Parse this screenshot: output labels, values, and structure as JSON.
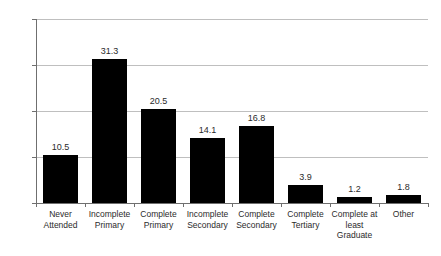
{
  "chart_data": {
    "type": "bar",
    "title": "",
    "subtitle": "",
    "xlabel": "",
    "ylabel": "",
    "ylim": [
      0,
      40
    ],
    "yticks": [
      "0",
      "10",
      "20",
      "30",
      "40"
    ],
    "grid": true,
    "legend": false,
    "bar_color": "#000000",
    "gridline_color": "#bfbfbf",
    "axis_color": "#6f6f6f",
    "categories": [
      "Never\nAttended",
      "Incomplete\nPrimary",
      "Complete\nPrimary",
      "Incomplete\nSecondary",
      "Complete\nSecondary",
      "Complete\nTertiary",
      "Complete at\nleast\nGraduate",
      "Other"
    ],
    "values": [
      10.5,
      31.3,
      20.5,
      14.1,
      16.8,
      3.9,
      1.2,
      1.8
    ],
    "value_labels": [
      "10.5",
      "31.3",
      "20.5",
      "14.1",
      "16.8",
      "3.9",
      "1.2",
      "1.8"
    ]
  }
}
